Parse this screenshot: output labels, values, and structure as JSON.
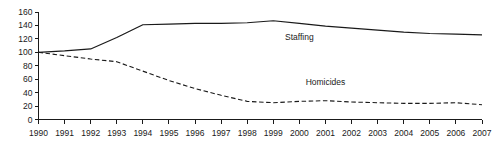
{
  "chart_data": {
    "type": "line",
    "title": "",
    "subtitle": "",
    "xlabel": "",
    "ylabel": "",
    "x": [
      1990,
      1991,
      1992,
      1993,
      1994,
      1995,
      1996,
      1997,
      1998,
      1999,
      2000,
      2001,
      2002,
      2003,
      2004,
      2005,
      2006,
      2007
    ],
    "categories": [
      "1990",
      "1991",
      "1992",
      "1993",
      "1994",
      "1995",
      "1996",
      "1997",
      "1998",
      "1999",
      "2000",
      "2001",
      "2002",
      "2003",
      "2004",
      "2005",
      "2006",
      "2007"
    ],
    "series": [
      {
        "name": "Staffing",
        "style": "solid",
        "color": "#1a1a1a",
        "values": [
          100,
          102,
          105,
          122,
          141,
          142,
          143,
          143,
          144,
          147,
          143,
          139,
          136,
          133,
          130,
          128,
          127,
          126
        ],
        "label_x": 2000,
        "label_y": 118
      },
      {
        "name": "Homicides",
        "style": "dashed",
        "color": "#1a1a1a",
        "values": [
          100,
          95,
          90,
          86,
          72,
          58,
          46,
          36,
          27,
          25,
          27,
          28,
          26,
          25,
          24,
          24,
          25,
          22
        ],
        "label_x": 2001,
        "label_y": 52
      }
    ],
    "ylim": [
      0,
      160
    ],
    "yticks": [
      0,
      20,
      40,
      60,
      80,
      100,
      120,
      140,
      160
    ],
    "ytick_labels": [
      "0",
      "20",
      "40",
      "60",
      "80",
      "100",
      "120",
      "140",
      "160"
    ],
    "xlim": [
      1990,
      2007
    ],
    "xticks": [
      1990,
      1991,
      1992,
      1993,
      1994,
      1995,
      1996,
      1997,
      1998,
      1999,
      2000,
      2001,
      2002,
      2003,
      2004,
      2005,
      2006,
      2007
    ],
    "grid": false,
    "legend": "inline-labels",
    "legend_position": "inline",
    "background_color": "#ffffff",
    "axis_color": "#1a1a1a"
  },
  "labels": {
    "staffing": "Staffing",
    "homicides": "Homicides"
  }
}
